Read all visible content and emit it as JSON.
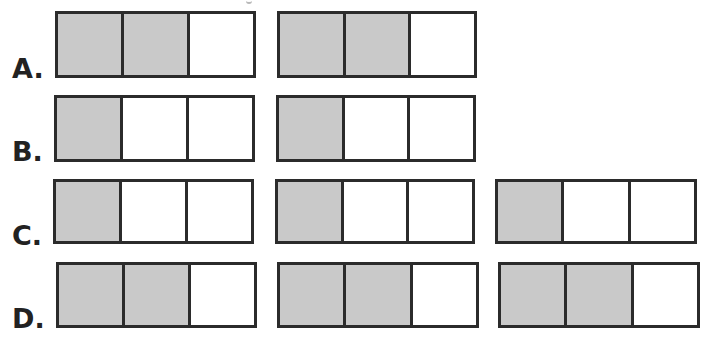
{
  "question_fragment": "g",
  "colors": {
    "shaded": "#c9c9c9",
    "unshaded": "#ffffff",
    "border": "#2b2b2b",
    "label": "#222222"
  },
  "options": [
    {
      "label": "A.",
      "bars": [
        {
          "parts": 3,
          "shaded": 2
        },
        {
          "parts": 3,
          "shaded": 2
        }
      ]
    },
    {
      "label": "B.",
      "bars": [
        {
          "parts": 3,
          "shaded": 1
        },
        {
          "parts": 3,
          "shaded": 1
        }
      ]
    },
    {
      "label": "C.",
      "bars": [
        {
          "parts": 3,
          "shaded": 1
        },
        {
          "parts": 3,
          "shaded": 1
        },
        {
          "parts": 3,
          "shaded": 1
        }
      ]
    },
    {
      "label": "D.",
      "bars": [
        {
          "parts": 3,
          "shaded": 2
        },
        {
          "parts": 3,
          "shaded": 2
        },
        {
          "parts": 3,
          "shaded": 2
        }
      ]
    }
  ]
}
